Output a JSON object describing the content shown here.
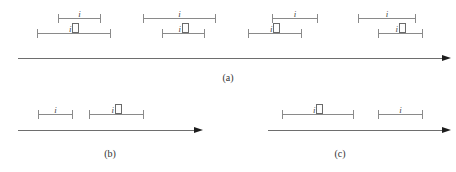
{
  "figure": {
    "label_plain": "i",
    "label_notdef": "i",
    "panels": [
      {
        "caption": "(a)",
        "caption_x": 228,
        "caption_y": 72,
        "axis": {
          "x": 18,
          "y": 58,
          "width": 424
        },
        "groups": [
          {
            "top": {
              "x": 58,
              "width": 43,
              "y": 14,
              "label": "i"
            },
            "bottom": {
              "x": 37,
              "width": 74,
              "y": 29,
              "label": "i"
            }
          },
          {
            "top": {
              "x": 143,
              "width": 73,
              "y": 14,
              "label": "i"
            },
            "bottom": {
              "x": 162,
              "width": 43,
              "y": 29,
              "label": "i"
            }
          },
          {
            "top": {
              "x": 272,
              "width": 46,
              "y": 14,
              "label": "i"
            },
            "bottom": {
              "x": 248,
              "width": 54,
              "y": 29,
              "label": "i"
            }
          },
          {
            "top": {
              "x": 358,
              "width": 58,
              "y": 14,
              "label": "i"
            },
            "bottom": {
              "x": 378,
              "width": 45,
              "y": 29,
              "label": "i"
            }
          }
        ]
      },
      {
        "caption": "(b)",
        "caption_x": 110,
        "caption_y": 148,
        "axis": {
          "x": 18,
          "y": 130,
          "width": 176
        },
        "intervals": [
          {
            "x": 38,
            "width": 35,
            "y": 110,
            "label": "i"
          },
          {
            "x": 89,
            "width": 55,
            "y": 110,
            "label": "i"
          }
        ]
      },
      {
        "caption": "(c)",
        "caption_x": 340,
        "caption_y": 148,
        "axis": {
          "x": 268,
          "y": 130,
          "width": 174
        },
        "intervals": [
          {
            "x": 282,
            "width": 72,
            "y": 110,
            "label": "i"
          },
          {
            "x": 378,
            "width": 45,
            "y": 110,
            "label": "i"
          }
        ]
      }
    ]
  }
}
